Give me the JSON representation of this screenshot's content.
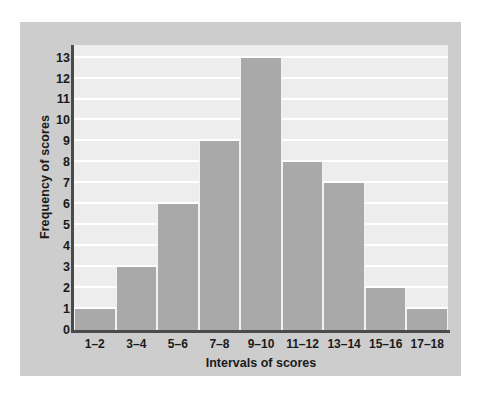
{
  "chart_data": {
    "type": "bar",
    "title": "",
    "subtitle": "",
    "xlabel": "Intervals of scores",
    "ylabel": "Frequency of scores",
    "categories": [
      "1–2",
      "3–4",
      "5–6",
      "7–8",
      "9–10",
      "11–12",
      "13–14",
      "15–16",
      "17–18"
    ],
    "values": [
      1,
      3,
      6,
      9,
      13,
      8,
      7,
      2,
      1
    ],
    "ylim": [
      0,
      13.6
    ],
    "ytick_labels": [
      "0",
      "1",
      "2",
      "3",
      "4",
      "5",
      "6",
      "7",
      "8",
      "9",
      "10",
      "11",
      "12",
      "13"
    ],
    "ytick_values": [
      0,
      1,
      2,
      3,
      4,
      5,
      6,
      7,
      8,
      9,
      10,
      11,
      12,
      13
    ],
    "grid": "horizontal",
    "legend": "none",
    "bar_gap": 0,
    "colors": {
      "bar_fill": "#a9a9a9",
      "bar_separator": "#f2f2f2",
      "plot_background": "#ededed",
      "panel_background": "#cdcdcd",
      "gridline": "#ffffff",
      "axis_line": "#4a4a4a",
      "text": "#1a1a1a",
      "page_background": "#ffffff"
    }
  }
}
